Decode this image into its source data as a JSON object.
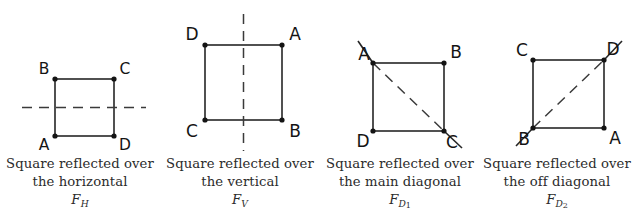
{
  "figures": [
    {
      "id": "reflection-horizontal",
      "symbol_letter": "F",
      "symbol_sub": "H",
      "caption_line1": "Square reflected over",
      "caption_line2": "the horizontal",
      "axis_type": "horizontal-dashed-line",
      "vertices": [
        {
          "label": "B",
          "position": "top-left"
        },
        {
          "label": "C",
          "position": "top-right"
        },
        {
          "label": "A",
          "position": "bottom-left"
        },
        {
          "label": "D",
          "position": "bottom-right"
        }
      ]
    },
    {
      "id": "reflection-vertical",
      "symbol_letter": "F",
      "symbol_sub": "V",
      "caption_line1": "Square reflected over",
      "caption_line2": "the vertical",
      "axis_type": "vertical-dashed-line",
      "vertices": [
        {
          "label": "D",
          "position": "top-left"
        },
        {
          "label": "A",
          "position": "top-right"
        },
        {
          "label": "C",
          "position": "bottom-left"
        },
        {
          "label": "B",
          "position": "bottom-right"
        }
      ]
    },
    {
      "id": "reflection-main-diagonal",
      "symbol_letter": "F",
      "symbol_sub": "D",
      "symbol_subnum": "1",
      "caption_line1": "Square reflected over",
      "caption_line2": "the main diagonal",
      "axis_type": "main-diagonal-dashed-line",
      "vertices": [
        {
          "label": "A",
          "position": "top-left"
        },
        {
          "label": "B",
          "position": "top-right"
        },
        {
          "label": "D",
          "position": "bottom-left"
        },
        {
          "label": "C",
          "position": "bottom-right"
        }
      ]
    },
    {
      "id": "reflection-off-diagonal",
      "symbol_letter": "F",
      "symbol_sub": "D",
      "symbol_subnum": "2",
      "caption_line1": "Square reflected over",
      "caption_line2": "the off diagonal",
      "axis_type": "off-diagonal-dashed-line",
      "vertices": [
        {
          "label": "C",
          "position": "top-left"
        },
        {
          "label": "D",
          "position": "top-right"
        },
        {
          "label": "B",
          "position": "bottom-left"
        },
        {
          "label": "A",
          "position": "bottom-right"
        }
      ]
    }
  ],
  "style": {
    "line_color": "#262626",
    "dash_color": "#3a3a3a",
    "text_color": "#2b2b2b",
    "background": "#ffffff"
  }
}
